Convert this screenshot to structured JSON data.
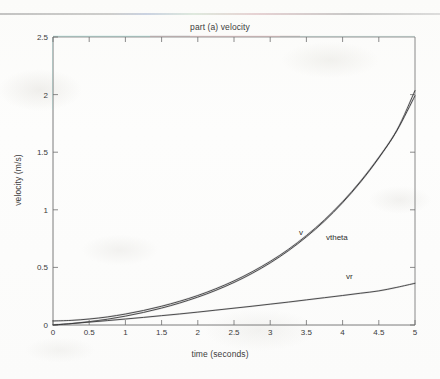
{
  "figure": {
    "title": "part (a) velocity",
    "background_color": "#fdfdfc",
    "axis_color": "#6e6e6e",
    "curve_color": "#333333"
  },
  "axes": {
    "xlabel": "time (seconds)",
    "ylabel": "velocity (m/s)",
    "x_ticks": [
      "0",
      "0.5",
      "1",
      "1.5",
      "2",
      "2.5",
      "3",
      "3.5",
      "4",
      "4.5",
      "5"
    ],
    "y_ticks": [
      "0",
      "0.5",
      "1",
      "1.5",
      "2",
      "2.5"
    ]
  },
  "annotations": {
    "v": "v",
    "vtheta": "vtheta",
    "vr": "vr"
  },
  "chart_data": {
    "type": "line",
    "title": "part (a) velocity",
    "xlabel": "time (seconds)",
    "ylabel": "velocity (m/s)",
    "xlim": [
      0,
      5
    ],
    "ylim": [
      0,
      2.5
    ],
    "xticks": [
      0,
      0.5,
      1,
      1.5,
      2,
      2.5,
      3,
      3.5,
      4,
      4.5,
      5
    ],
    "yticks": [
      0,
      0.5,
      1,
      1.5,
      2,
      2.5
    ],
    "grid": false,
    "legend": "inline-annotations",
    "x": [
      0,
      0.25,
      0.5,
      0.75,
      1,
      1.25,
      1.5,
      1.75,
      2,
      2.25,
      2.5,
      2.75,
      3,
      3.25,
      3.5,
      3.75,
      4,
      4.25,
      4.5,
      4.75,
      5
    ],
    "series": [
      {
        "name": "v",
        "label": "v",
        "label_position": {
          "x": 3.57,
          "y": 0.78
        },
        "values": [
          0.035,
          0.04,
          0.052,
          0.07,
          0.095,
          0.126,
          0.163,
          0.206,
          0.256,
          0.315,
          0.383,
          0.462,
          0.552,
          0.656,
          0.776,
          0.913,
          1.07,
          1.25,
          1.455,
          1.69,
          2.035
        ]
      },
      {
        "name": "vtheta",
        "label": "vtheta",
        "label_position": {
          "x": 3.95,
          "y": 0.74
        },
        "values": [
          0.0,
          0.012,
          0.029,
          0.05,
          0.077,
          0.109,
          0.147,
          0.191,
          0.242,
          0.301,
          0.369,
          0.448,
          0.539,
          0.644,
          0.765,
          0.903,
          1.062,
          1.243,
          1.45,
          1.688,
          1.99
        ]
      },
      {
        "name": "vr",
        "label": "vr",
        "label_position": {
          "x": 4.12,
          "y": 0.45
        },
        "values": [
          0.0,
          0.012,
          0.025,
          0.038,
          0.052,
          0.066,
          0.081,
          0.096,
          0.112,
          0.129,
          0.146,
          0.163,
          0.181,
          0.199,
          0.218,
          0.237,
          0.256,
          0.276,
          0.296,
          0.327,
          0.362
        ]
      }
    ]
  }
}
